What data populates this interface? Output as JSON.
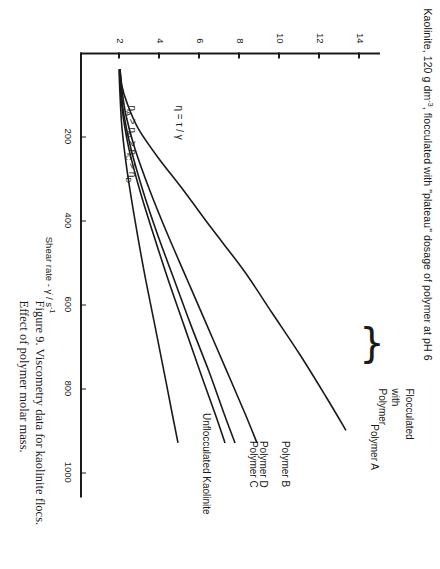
{
  "figure": {
    "title_prefix": "Kaolinite, 120 g dm",
    "title_sup": "-3",
    "title_rest": ", flocculated with \"plateau\" dosage of polymer at pH 6",
    "caption": "Figure 9.  Viscometry data for kaolinite flocs.  Effect of polymer molar mass."
  },
  "annotations": {
    "equation": "η = τ / γ",
    "ordering_prefix": "η",
    "ordering": "ηA > ηB > ηC > ηD",
    "flocculated_line1": "Flocculated",
    "flocculated_line2": "with",
    "flocculated_line3": "Polymer",
    "brace_glyph": "}"
  },
  "axes": {
    "x": {
      "label_prefix": "Shear rate -  γ̇ / s",
      "label_sup": "-1",
      "ticks": [
        200,
        400,
        600,
        800,
        1000
      ],
      "min": 0,
      "max": 1060
    },
    "y": {
      "ticks": [
        2,
        4,
        6,
        8,
        10,
        12,
        14
      ],
      "min": 0,
      "max": 15
    }
  },
  "chart_data": {
    "type": "line",
    "title": "Kaolinite, 120 g dm-3, flocculated with \"plateau\" dosage of polymer at pH 6",
    "xlabel": "Shear rate - γ̇ / s-1",
    "ylabel": "η / mPa s",
    "xlim": [
      0,
      1060
    ],
    "ylim": [
      0,
      15
    ],
    "grid": false,
    "legend": "inline-curve-labels",
    "series": [
      {
        "name": "Polymer A",
        "label": "Polymer A",
        "x": [
          40,
          80,
          120,
          180,
          250,
          330,
          420,
          520,
          620,
          720,
          820,
          900
        ],
        "y": [
          2.0,
          2.1,
          2.35,
          2.9,
          3.9,
          5.2,
          6.6,
          8.2,
          9.6,
          11.0,
          12.3,
          13.3
        ]
      },
      {
        "name": "Polymer B",
        "label": "Polymer B",
        "x": [
          40,
          90,
          150,
          230,
          330,
          430,
          540,
          650,
          760,
          860,
          930
        ],
        "y": [
          2.0,
          2.1,
          2.3,
          2.75,
          3.5,
          4.35,
          5.35,
          6.35,
          7.35,
          8.25,
          8.85
        ]
      },
      {
        "name": "Polymer D",
        "label": "Polymer D",
        "x": [
          40,
          90,
          150,
          230,
          330,
          430,
          540,
          650,
          760,
          860,
          930
        ],
        "y": [
          2.0,
          2.05,
          2.2,
          2.55,
          3.15,
          3.85,
          4.7,
          5.55,
          6.45,
          7.2,
          7.75
        ]
      },
      {
        "name": "Polymer C",
        "label": "Polymer C",
        "x": [
          40,
          90,
          150,
          230,
          330,
          430,
          540,
          650,
          760,
          860,
          930
        ],
        "y": [
          2.0,
          2.03,
          2.15,
          2.45,
          3.0,
          3.65,
          4.4,
          5.2,
          6.0,
          6.75,
          7.25
        ]
      },
      {
        "name": "Unflocculated Kaolinite",
        "label": "Unflocculated Kaolinite",
        "x": [
          40,
          100,
          180,
          280,
          400,
          520,
          640,
          760,
          870,
          930
        ],
        "y": [
          1.95,
          2.0,
          2.1,
          2.35,
          2.75,
          3.2,
          3.7,
          4.2,
          4.65,
          4.9
        ]
      }
    ]
  }
}
